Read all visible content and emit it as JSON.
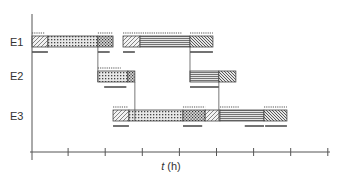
{
  "diagram": {
    "type": "gantt",
    "xlabel_var": "t",
    "xlabel_unit": " (h)",
    "tick_count": 9,
    "rows": [
      {
        "label": "E1",
        "segments": [
          {
            "start": 0.0,
            "end": 0.43,
            "pattern": "hatch-fwd"
          },
          {
            "start": 0.43,
            "end": 1.78,
            "pattern": "dots"
          },
          {
            "start": 1.78,
            "end": 2.19,
            "pattern": "cross"
          },
          {
            "start": 2.46,
            "end": 2.92,
            "pattern": "hatch-fwd"
          },
          {
            "start": 2.92,
            "end": 4.27,
            "pattern": "hlines"
          },
          {
            "start": 4.27,
            "end": 4.89,
            "pattern": "hatch-back"
          }
        ],
        "dotlines": [
          [
            0.0,
            0.35
          ],
          [
            1.78,
            2.19
          ],
          [
            2.46,
            4.05
          ],
          [
            4.27,
            4.89
          ]
        ],
        "underlines": [
          [
            0.0,
            0.43
          ],
          [
            1.78,
            2.1
          ],
          [
            2.46,
            2.78
          ],
          [
            4.27,
            4.89
          ]
        ]
      },
      {
        "label": "E2",
        "segments": [
          {
            "start": 1.78,
            "end": 2.59,
            "pattern": "dots"
          },
          {
            "start": 2.59,
            "end": 2.78,
            "pattern": "cross"
          },
          {
            "start": 4.27,
            "end": 5.05,
            "pattern": "hlines"
          },
          {
            "start": 5.05,
            "end": 5.51,
            "pattern": "hatch-back"
          }
        ],
        "dotlines": [
          [
            1.78,
            2.4
          ]
        ],
        "underlines": [
          [
            1.95,
            2.55
          ],
          [
            4.27,
            5.05
          ]
        ]
      },
      {
        "label": "E3",
        "segments": [
          {
            "start": 2.19,
            "end": 2.62,
            "pattern": "hatch-fwd"
          },
          {
            "start": 2.62,
            "end": 4.08,
            "pattern": "dots"
          },
          {
            "start": 4.08,
            "end": 4.68,
            "pattern": "cross"
          },
          {
            "start": 4.68,
            "end": 5.08,
            "pattern": "hatch-fwd"
          },
          {
            "start": 5.08,
            "end": 6.27,
            "pattern": "hlines"
          },
          {
            "start": 6.27,
            "end": 6.89,
            "pattern": "hatch-back"
          }
        ],
        "dotlines": [
          [
            2.19,
            2.6
          ],
          [
            4.08,
            4.68
          ],
          [
            5.08,
            5.6
          ],
          [
            6.27,
            6.89
          ]
        ],
        "underlines": [
          [
            2.19,
            2.62
          ],
          [
            4.08,
            4.6
          ],
          [
            5.75,
            6.27
          ],
          [
            6.3,
            6.89
          ]
        ]
      }
    ],
    "connectors": [
      {
        "x": 1.78,
        "from_row": 0,
        "to_row": 1
      },
      {
        "x": 2.78,
        "from_row": 1,
        "to_row": 2
      },
      {
        "x": 4.27,
        "from_row": 0,
        "to_row": 1
      },
      {
        "x": 5.05,
        "from_row": 1,
        "to_row": 2
      }
    ]
  }
}
